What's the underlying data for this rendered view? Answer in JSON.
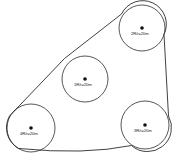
{
  "diagram": {
    "type": "belt-and-pulley-schematic",
    "stroke_color": "#2b2b2b",
    "dot_color": "#111111",
    "background_color": "#ffffff",
    "pulleys": [
      {
        "id": "pulley-middle",
        "label": "1R/r=20m",
        "cx": 85,
        "cy": 79,
        "r": 23,
        "label_x": 74,
        "label_y": 84
      },
      {
        "id": "pulley-top-right",
        "label": "2R/r=20m",
        "cx": 142,
        "cy": 28,
        "r": 23,
        "label_x": 131,
        "label_y": 33
      },
      {
        "id": "pulley-bottom-right",
        "label": "3R/r=20m",
        "cx": 145,
        "cy": 125,
        "r": 24,
        "label_x": 134,
        "label_y": 130
      },
      {
        "id": "pulley-bottom-left",
        "label": "4R/r=20m",
        "cx": 31,
        "cy": 128,
        "r": 24,
        "label_x": 20,
        "label_y": 133
      }
    ],
    "belt": {
      "name": "belt-outline",
      "path": "M 64.5 58.5 L 121.5 14.0 A 23 23 0 0 1 164.0 34.5 L 168.5 116.0 A 24 24 0 0 1 131.5 145.5 Q 85 155 18.5 148.5 A 24 24 0 0 1 9.5 116.0 L 64.5 58.5"
    }
  }
}
